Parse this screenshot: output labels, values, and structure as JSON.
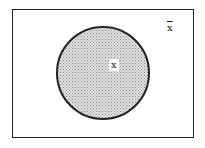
{
  "diagram": {
    "type": "venn",
    "universe": {
      "label": ""
    },
    "sets": [
      {
        "name": "X",
        "label": "x",
        "fill": "#c8c8c8",
        "stroke": "#222222"
      }
    ],
    "complement": {
      "label": "x"
    }
  }
}
